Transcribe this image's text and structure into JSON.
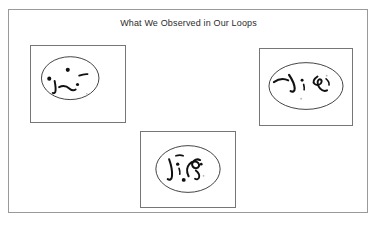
{
  "figure": {
    "title": "What We Observed in Our Loops",
    "background_color": "#ffffff",
    "frame_color": "#9a9a9a",
    "ink_color": "#111111",
    "loop_outline_color": "#2a2a2a"
  },
  "panels": [
    {
      "id": "panel-1",
      "position": "top-left",
      "loop_shape": "ellipse",
      "contents_description": "four dark dots and two short curved squiggle strokes inside the loop",
      "dot_count": 4,
      "squiggle_count": 3
    },
    {
      "id": "panel-2",
      "position": "top-right",
      "loop_shape": "ellipse",
      "contents_description": "three connected curved squiggle strokes with a small dot inside the loop",
      "dot_count": 2,
      "squiggle_count": 3
    },
    {
      "id": "panel-3",
      "position": "bottom-center",
      "loop_shape": "ellipse",
      "contents_description": "a cluster of curved squiggle strokes with dots inside the loop",
      "dot_count": 3,
      "squiggle_count": 4
    }
  ]
}
